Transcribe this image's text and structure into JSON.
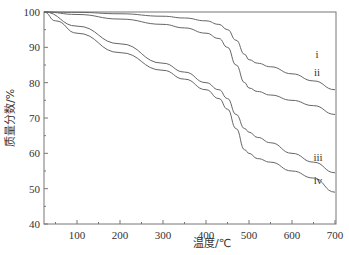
{
  "chart_data": {
    "type": "line",
    "title": "",
    "xlabel": "温度/℃",
    "ylabel": "质量分数/%",
    "xlim": [
      25,
      700
    ],
    "ylim": [
      40,
      100
    ],
    "xticks": [
      100,
      200,
      300,
      400,
      500,
      600,
      700
    ],
    "yticks": [
      40,
      50,
      60,
      70,
      80,
      90,
      100
    ],
    "grid": false,
    "legend_position": "inline-right",
    "series": [
      {
        "name": "i",
        "x": [
          25,
          100,
          200,
          300,
          350,
          400,
          430,
          450,
          470,
          490,
          500,
          520,
          550,
          600,
          650,
          700
        ],
        "y": [
          100,
          99.9,
          99.5,
          98.8,
          98.3,
          97.5,
          96.5,
          95,
          92,
          88,
          86.5,
          85.5,
          84.5,
          82.5,
          80.5,
          78
        ]
      },
      {
        "name": "ii",
        "x": [
          25,
          100,
          200,
          300,
          350,
          400,
          430,
          450,
          470,
          490,
          500,
          520,
          550,
          600,
          650,
          700
        ],
        "y": [
          100,
          99.3,
          98,
          96.5,
          95.5,
          94,
          92.5,
          90,
          85,
          80,
          78.5,
          77.5,
          76.5,
          75,
          73.5,
          71
        ]
      },
      {
        "name": "iii",
        "x": [
          25,
          100,
          200,
          300,
          350,
          400,
          430,
          450,
          470,
          490,
          500,
          520,
          550,
          600,
          650,
          700
        ],
        "y": [
          100,
          96,
          91,
          85.5,
          83,
          80,
          78,
          75.5,
          71,
          67,
          66,
          64.5,
          63,
          60,
          57.5,
          54.5
        ]
      },
      {
        "name": "iv",
        "x": [
          25,
          50,
          100,
          200,
          300,
          350,
          400,
          430,
          450,
          470,
          490,
          500,
          520,
          550,
          600,
          650,
          700
        ],
        "y": [
          100,
          97.5,
          94,
          88.5,
          83.5,
          81,
          78,
          75.5,
          72.5,
          67,
          61,
          60,
          58.5,
          57.5,
          55,
          53,
          49
        ]
      }
    ]
  }
}
